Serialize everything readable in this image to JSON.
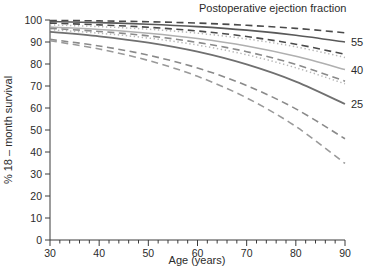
{
  "chart_data": {
    "type": "line",
    "title": "Postoperative ejection fraction",
    "xlabel": "Age (years)",
    "ylabel": "% 18 – month survival",
    "xlim": [
      30,
      90
    ],
    "ylim": [
      0,
      100
    ],
    "xticks": [
      30,
      40,
      50,
      60,
      70,
      80,
      90
    ],
    "xtick_labels": [
      "30",
      "40",
      "50",
      "60",
      "70",
      "80",
      "90"
    ],
    "x_minor_tick_step": 2,
    "yticks": [
      0,
      10,
      20,
      30,
      40,
      50,
      60,
      70,
      80,
      90,
      100
    ],
    "ytick_labels": [
      "0",
      "10",
      "20",
      "30",
      "40",
      "50",
      "60",
      "70",
      "80",
      "90",
      "100"
    ],
    "grid": false,
    "legend_position": "right-inline",
    "x": [
      30,
      40,
      50,
      60,
      70,
      80,
      90
    ],
    "series": [
      {
        "name": "55 upper CI",
        "group": "55",
        "style": "dashed",
        "color": "#4a4a4a",
        "width": 1.6,
        "values": [
          99.8,
          99.6,
          99.2,
          98.6,
          97.6,
          96.2,
          94.2
        ]
      },
      {
        "name": "55 estimate",
        "group": "55",
        "style": "solid",
        "color": "#595959",
        "width": 1.6,
        "values": [
          99.3,
          98.8,
          98.1,
          97.0,
          95.4,
          93.1,
          90.0
        ]
      },
      {
        "name": "55 lower CI",
        "group": "55",
        "style": "dashed",
        "color": "#4a4a4a",
        "width": 1.6,
        "values": [
          98.6,
          97.8,
          96.7,
          95.0,
          92.5,
          89.0,
          84.4
        ]
      },
      {
        "name": "40 upper CI",
        "group": "40",
        "style": "dotted",
        "color": "#b8b8b8",
        "width": 1.5,
        "values": [
          97.8,
          97.0,
          95.8,
          94.0,
          91.4,
          87.8,
          83.0
        ]
      },
      {
        "name": "40 estimate",
        "group": "40",
        "style": "solid",
        "color": "#b0b0b0",
        "width": 1.6,
        "values": [
          96.8,
          95.7,
          94.0,
          91.6,
          88.2,
          83.5,
          77.5
        ]
      },
      {
        "name": "40 lower CI",
        "group": "40",
        "style": "dotted",
        "color": "#b8b8b8",
        "width": 1.5,
        "values": [
          95.6,
          94.0,
          91.8,
          88.6,
          84.2,
          78.3,
          71.0
        ]
      },
      {
        "name": "25 upper CI",
        "group": "25",
        "style": "dashed",
        "color": "#8a8a8a",
        "width": 1.6,
        "values": [
          96.2,
          94.8,
          92.8,
          89.8,
          85.6,
          79.8,
          72.2
        ]
      },
      {
        "name": "25 estimate",
        "group": "25",
        "style": "solid",
        "color": "#707070",
        "width": 1.8,
        "values": [
          94.6,
          92.6,
          89.7,
          85.6,
          79.8,
          72.0,
          61.8
        ]
      },
      {
        "name": "25 lower CI",
        "group": "25",
        "style": "dashed",
        "color": "#8a8a8a",
        "width": 1.6,
        "values": [
          91.2,
          88.2,
          84.0,
          78.2,
          70.2,
          59.6,
          46.0
        ]
      },
      {
        "name": "25 extreme lower CI",
        "group": "25",
        "style": "dashed",
        "color": "#9a9a9a",
        "width": 1.6,
        "values": [
          90.6,
          86.8,
          81.6,
          74.4,
          64.6,
          51.6,
          34.8
        ]
      }
    ],
    "annotations": [
      {
        "text": "55",
        "x": 90,
        "y": 90.0,
        "group": "55"
      },
      {
        "text": "40",
        "x": 90,
        "y": 77.5,
        "group": "40"
      },
      {
        "text": "25",
        "x": 90,
        "y": 61.8,
        "group": "25"
      }
    ]
  }
}
